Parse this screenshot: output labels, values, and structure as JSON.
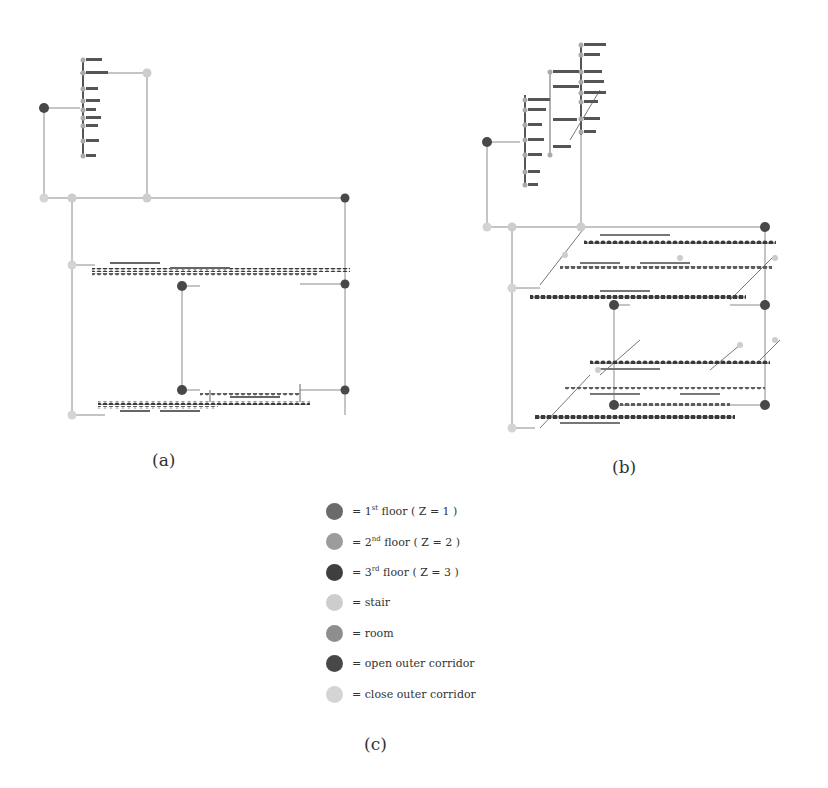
{
  "captions": {
    "a": "(a)",
    "b": "(b)",
    "c": "(c)"
  },
  "legend": {
    "items": [
      {
        "label": "= 1st floor ( Z = 1 )",
        "base": "= 1",
        "sup": "st",
        "rest": " floor ( Z = 1 )",
        "color": "#6b6b6b",
        "category": "1st-floor"
      },
      {
        "label": "= 2nd floor ( Z = 2 )",
        "base": "= 2",
        "sup": "nd",
        "rest": " floor ( Z = 2 )",
        "color": "#9c9c9c",
        "category": "2nd-floor"
      },
      {
        "label": "= 3rd floor ( Z = 3 )",
        "base": "= 3",
        "sup": "rd",
        "rest": " floor ( Z = 3 )",
        "color": "#3f3f3f",
        "category": "3rd-floor"
      },
      {
        "label": "= stair",
        "base": "= stair",
        "sup": "",
        "rest": "",
        "color": "#cdcdcd",
        "category": "stair"
      },
      {
        "label": "= room",
        "base": "= room",
        "sup": "",
        "rest": "",
        "color": "#8e8e8e",
        "category": "room"
      },
      {
        "label": "= open outer corridor",
        "base": "= open outer corridor",
        "sup": "",
        "rest": "",
        "color": "#484848",
        "category": "open-outer-corridor"
      },
      {
        "label": "= close outer corridor",
        "base": "= close outer corridor",
        "sup": "",
        "rest": "",
        "color": "#d4d4d4",
        "category": "close-outer-corridor"
      }
    ]
  },
  "diagram_a": {
    "node_labels": [
      "SE3_1",
      "SE3_2",
      "SE3_3",
      "SF2_1",
      "SF2_2",
      "SF2_3",
      "SF1_1",
      "SF1_2",
      "SF1_3",
      "SD3_1",
      "SD3_2"
    ]
  },
  "diagram_b": {
    "node_labels": [
      "SE3_1",
      "SE3_2",
      "SE3_3",
      "SE2_1",
      "SE2_2",
      "SE2_3",
      "SF1_1",
      "SF1_2",
      "SF1_3",
      "SF2_1",
      "SF2_2",
      "SF3_1",
      "SD3_1",
      "SD3_2",
      "SD3_3"
    ]
  }
}
